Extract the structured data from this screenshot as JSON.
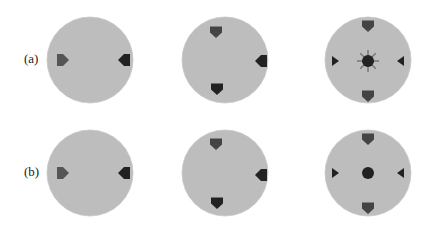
{
  "figure": {
    "rows": [
      {
        "label": "(a)",
        "label_pos": {
          "x": 24,
          "y": 51
        },
        "disks": [
          {
            "cx": 90,
            "cy": 60,
            "r": 43,
            "markers": [
              {
                "type": "pentagon-right",
                "x": 63,
                "y": 60,
                "color": "#555555"
              },
              {
                "type": "pentagon-left",
                "x": 124,
                "y": 60,
                "color": "#222222"
              }
            ]
          },
          {
            "cx": 225,
            "cy": 60,
            "r": 43,
            "markers": [
              {
                "type": "pentagon-down",
                "x": 216,
                "y": 32,
                "color": "#444444"
              },
              {
                "type": "pentagon-left",
                "x": 261,
                "y": 61,
                "color": "#222222"
              },
              {
                "type": "pentagon-down",
                "x": 217,
                "y": 89,
                "color": "#222222"
              }
            ]
          },
          {
            "cx": 368,
            "cy": 60,
            "r": 43,
            "markers": [
              {
                "type": "pentagon-down",
                "x": 368,
                "y": 26,
                "color": "#444444"
              },
              {
                "type": "triangle-right",
                "x": 335,
                "y": 61,
                "color": "#222222"
              },
              {
                "type": "star-circle",
                "x": 368,
                "y": 61,
                "color": "#222222"
              },
              {
                "type": "triangle-left",
                "x": 401,
                "y": 61,
                "color": "#222222"
              },
              {
                "type": "pentagon-down",
                "x": 368,
                "y": 96,
                "color": "#444444"
              }
            ]
          }
        ]
      },
      {
        "label": "(b)",
        "label_pos": {
          "x": 24,
          "y": 164
        },
        "disks": [
          {
            "cx": 90,
            "cy": 173,
            "r": 43,
            "markers": [
              {
                "type": "pentagon-right",
                "x": 63,
                "y": 173,
                "color": "#555555"
              },
              {
                "type": "pentagon-left",
                "x": 124,
                "y": 173,
                "color": "#222222"
              }
            ]
          },
          {
            "cx": 225,
            "cy": 173,
            "r": 43,
            "markers": [
              {
                "type": "pentagon-down",
                "x": 216,
                "y": 144,
                "color": "#444444"
              },
              {
                "type": "pentagon-left",
                "x": 261,
                "y": 175,
                "color": "#222222"
              },
              {
                "type": "pentagon-down",
                "x": 217,
                "y": 203,
                "color": "#222222"
              }
            ]
          },
          {
            "cx": 368,
            "cy": 173,
            "r": 43,
            "markers": [
              {
                "type": "pentagon-down",
                "x": 368,
                "y": 139,
                "color": "#444444"
              },
              {
                "type": "triangle-right",
                "x": 335,
                "y": 173,
                "color": "#222222"
              },
              {
                "type": "circle",
                "x": 368,
                "y": 173,
                "color": "#222222"
              },
              {
                "type": "triangle-left",
                "x": 401,
                "y": 173,
                "color": "#222222"
              },
              {
                "type": "pentagon-down",
                "x": 368,
                "y": 208,
                "color": "#444444"
              }
            ]
          }
        ]
      }
    ],
    "disk_color": "#bdbdbd"
  }
}
